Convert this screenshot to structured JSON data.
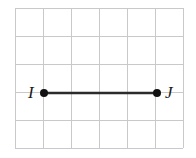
{
  "figure": {
    "width": 196,
    "height": 158,
    "background_color": "#ffffff"
  },
  "grid": {
    "line_color": "#c9c9c9",
    "line_width": 1,
    "columns": 6,
    "rows": 5,
    "cell_size": 28,
    "x_lines": [
      15,
      43,
      71,
      99,
      127,
      155,
      183
    ],
    "y_lines": [
      8,
      36,
      64,
      92,
      120,
      148
    ]
  },
  "segment": {
    "name": "IJ",
    "color": "#2b2b2b",
    "stroke_width": 2.6,
    "x1": 44,
    "y1": 93,
    "x2": 157,
    "y2": 93,
    "length_cells": 4
  },
  "points": [
    {
      "label": "I",
      "cx": 44,
      "cy": 93,
      "r": 4,
      "color": "#111111",
      "label_x": 28,
      "label_y": 84,
      "label_side": "left"
    },
    {
      "label": "J",
      "cx": 157,
      "cy": 93,
      "r": 4,
      "color": "#111111",
      "label_x": 165,
      "label_y": 84,
      "label_side": "right"
    }
  ],
  "chart_data": {
    "type": "scatter",
    "xlabel": "",
    "ylabel": "",
    "grid": true,
    "legend": "none",
    "xlim": [
      0,
      6
    ],
    "ylim": [
      0,
      5
    ],
    "categories": [
      "I",
      "J"
    ],
    "x": [
      1,
      5
    ],
    "y": [
      2,
      2
    ],
    "series": [
      {
        "name": "segment-IJ",
        "points": [
          {
            "label": "I",
            "x": 1,
            "y": 2
          },
          {
            "label": "J",
            "x": 5,
            "y": 2
          }
        ],
        "values": [
          2,
          2
        ]
      }
    ],
    "annotations": [
      "I",
      "J"
    ]
  }
}
